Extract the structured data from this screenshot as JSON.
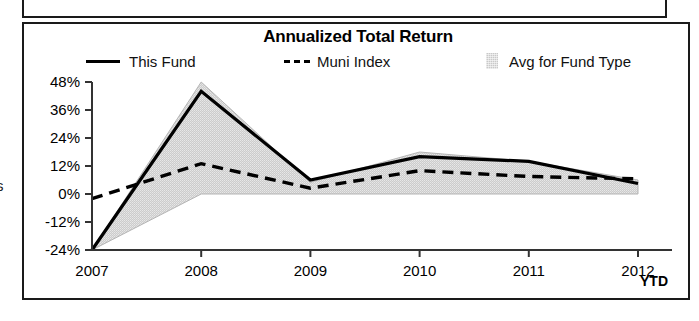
{
  "panel": {
    "title": "Annualized Total Return",
    "axis_note": "YTD"
  },
  "legend": [
    {
      "label": "This Fund",
      "marker": "solid-line-swatch"
    },
    {
      "label": "Muni Index",
      "marker": "dashed-line-swatch"
    },
    {
      "label": "Avg for Fund Type",
      "marker": "area-fill-swatch"
    }
  ],
  "edge_fragment": "s",
  "colors": {
    "line": "#000000",
    "area_fill": "#c9c9c9",
    "frame": "#1a1a1a",
    "text": "#000000"
  },
  "chart_data": {
    "type": "line",
    "title": "Annualized Total Return",
    "xlabel": "",
    "ylabel": "",
    "grid": false,
    "legend_position": "top",
    "categories": [
      "2007",
      "2008",
      "2009",
      "2010",
      "2011",
      "2012"
    ],
    "x_tick_labels": [
      "2007",
      "2008",
      "2009",
      "2010",
      "2011",
      "2012"
    ],
    "x_axis_suffix": "YTD",
    "y_tick_labels": [
      "48%",
      "36%",
      "24%",
      "12%",
      "0%",
      "-12%",
      "-24%"
    ],
    "y_ticks": [
      48,
      36,
      24,
      12,
      0,
      -12,
      -24
    ],
    "ylim": [
      -24,
      48
    ],
    "series": [
      {
        "name": "This Fund",
        "style": "solid",
        "values": [
          -24,
          44,
          6,
          16,
          14,
          4.5
        ]
      },
      {
        "name": "Muni Index",
        "style": "dashed",
        "values": [
          -2,
          13,
          2.5,
          10,
          7.5,
          6.5
        ]
      },
      {
        "name": "Avg for Fund Type",
        "style": "area",
        "upper": [
          -24,
          48,
          5,
          18,
          14,
          6
        ],
        "lower": [
          -24,
          0,
          0,
          0,
          0,
          0
        ]
      }
    ]
  }
}
